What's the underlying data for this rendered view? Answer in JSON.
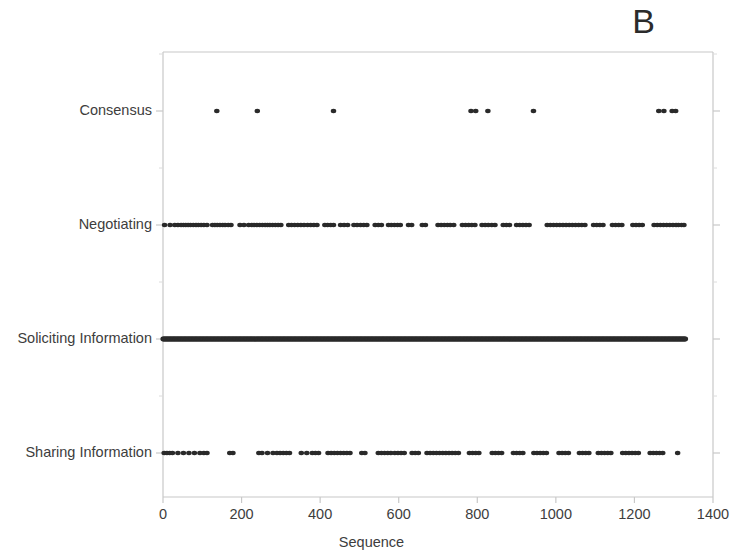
{
  "panel": {
    "label": "B"
  },
  "chart_data": {
    "type": "scatter",
    "title": "",
    "subtitle": "",
    "xlabel": "Sequence",
    "ylabel": "",
    "xlim": [
      0,
      1400
    ],
    "xticks": [
      0,
      200,
      400,
      600,
      800,
      1000,
      1200,
      1400
    ],
    "xticklabels": [
      "0",
      "200",
      "400",
      "600",
      "800",
      "1000",
      "1200",
      "1400"
    ],
    "categories": [
      "Sharing Information",
      "Soliciting Information",
      "Negotiating",
      "Consensus"
    ],
    "yticklabels": [
      "Consensus",
      "Negotiating",
      "Soliciting Information",
      "Sharing Information"
    ],
    "grid": false,
    "legend": "none",
    "marker": {
      "shape": "circle",
      "color": "#2a2a2a",
      "size": 4
    },
    "axis_color": "#c8c8c8",
    "series": [
      {
        "name": "Consensus",
        "category": "Consensus",
        "x": [
          137,
          240,
          434,
          784,
          796,
          827,
          943,
          1262,
          1275,
          1296,
          1305
        ]
      },
      {
        "name": "Negotiating",
        "category": "Negotiating",
        "x": [
          4,
          18,
          30,
          38,
          46,
          52,
          58,
          64,
          70,
          77,
          84,
          90,
          97,
          104,
          112,
          126,
          132,
          138,
          145,
          152,
          158,
          166,
          173,
          196,
          206,
          218,
          226,
          232,
          239,
          246,
          253,
          260,
          266,
          272,
          279,
          286,
          293,
          300,
          320,
          327,
          335,
          343,
          351,
          359,
          368,
          376,
          384,
          392,
          412,
          419,
          427,
          434,
          452,
          461,
          470,
          486,
          494,
          503,
          511,
          519,
          540,
          548,
          556,
          574,
          581,
          589,
          597,
          604,
          625,
          633,
          660,
          668,
          700,
          708,
          716,
          724,
          731,
          740,
          762,
          770,
          778,
          786,
          794,
          812,
          820,
          828,
          837,
          845,
          866,
          874,
          882,
          900,
          908,
          916,
          924,
          932,
          978,
          986,
          994,
          1002,
          1010,
          1018,
          1026,
          1034,
          1042,
          1050,
          1058,
          1066,
          1074,
          1096,
          1104,
          1112,
          1120,
          1144,
          1152,
          1160,
          1168,
          1196,
          1204,
          1212,
          1220,
          1250,
          1258,
          1266,
          1274,
          1282,
          1290,
          1298,
          1306,
          1312,
          1320,
          1326
        ]
      },
      {
        "name": "Soliciting Information",
        "category": "Soliciting Information",
        "x_range": [
          0,
          1330
        ],
        "density": "continuous",
        "note": "near-continuous dense band of points spanning the full sequence"
      },
      {
        "name": "Sharing Information",
        "category": "Sharing Information",
        "x": [
          3,
          10,
          17,
          24,
          38,
          52,
          66,
          80,
          94,
          104,
          112,
          170,
          178,
          244,
          252,
          266,
          280,
          290,
          298,
          306,
          314,
          322,
          352,
          366,
          380,
          388,
          396,
          420,
          428,
          436,
          444,
          452,
          460,
          468,
          476,
          506,
          514,
          548,
          556,
          564,
          572,
          580,
          590,
          598,
          606,
          614,
          634,
          642,
          650,
          672,
          680,
          688,
          696,
          704,
          712,
          720,
          728,
          736,
          744,
          752,
          780,
          788,
          796,
          804,
          838,
          846,
          854,
          862,
          892,
          900,
          908,
          916,
          944,
          952,
          960,
          968,
          976,
          1008,
          1016,
          1024,
          1032,
          1060,
          1068,
          1076,
          1084,
          1108,
          1116,
          1124,
          1132,
          1140,
          1170,
          1178,
          1186,
          1194,
          1202,
          1210,
          1240,
          1248,
          1256,
          1264,
          1272,
          1310
        ]
      }
    ]
  }
}
